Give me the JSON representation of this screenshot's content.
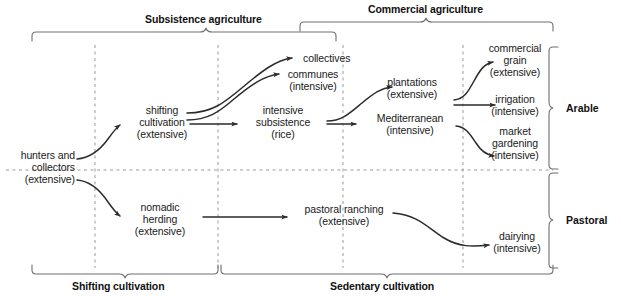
{
  "diagram": {
    "type": "flow-diagram",
    "colors": {
      "background": "#ffffff",
      "text": "#1a1a1a",
      "arrow": "#2b2b2b",
      "bracket": "#6f6f6f",
      "dashed_guide": "#9a9a9a"
    }
  },
  "top_groups": [
    {
      "label": "Subsistence agriculture",
      "span_start_x": 32,
      "span_end_x": 336,
      "tick_x": 206
    },
    {
      "label": "Commercial agriculture",
      "span_start_x": 300,
      "span_end_x": 553,
      "tick_x": 426
    }
  ],
  "bottom_groups": [
    {
      "label": "Shifting cultivation",
      "span_start_x": 32,
      "span_end_x": 218,
      "tick_x": 125
    },
    {
      "label": "Sedentary cultivation",
      "span_start_x": 221,
      "span_end_x": 553,
      "tick_x": 387
    }
  ],
  "side_groups": [
    {
      "label": "Arable",
      "span_start_y": 47,
      "span_end_y": 169,
      "tick_y": 108
    },
    {
      "label": "Pastoral",
      "span_start_y": 173,
      "span_end_y": 268,
      "tick_y": 220
    }
  ],
  "nodes": [
    {
      "id": "hunters",
      "lines": [
        "hunters and",
        "collectors",
        "(extensive)"
      ],
      "x": 3,
      "y": 149,
      "align": "right",
      "width": 72
    },
    {
      "id": "shifting",
      "lines": [
        "shifting",
        "cultivation",
        "(extensive)"
      ],
      "x": 121,
      "y": 104,
      "align": "center",
      "width": 82
    },
    {
      "id": "nomadic",
      "lines": [
        "nomadic",
        "herding",
        "(extensive)"
      ],
      "x": 119,
      "y": 201,
      "align": "center",
      "width": 82
    },
    {
      "id": "collectives",
      "lines": [
        "collectives"
      ],
      "x": 303,
      "y": 52,
      "align": "left",
      "width": 70
    },
    {
      "id": "communes",
      "lines": [
        "communes",
        "(intensive)"
      ],
      "x": 274,
      "y": 68,
      "align": "center",
      "width": 78
    },
    {
      "id": "intensive_sub",
      "lines": [
        "intensive",
        "subsistence",
        "(rice)"
      ],
      "x": 244,
      "y": 104,
      "align": "center",
      "width": 78
    },
    {
      "id": "plantations",
      "lines": [
        "plantations",
        "(extensive)"
      ],
      "x": 371,
      "y": 76,
      "align": "center",
      "width": 82
    },
    {
      "id": "mediterranean",
      "lines": [
        "Mediterranean",
        "(intensive)"
      ],
      "x": 362,
      "y": 112,
      "align": "center",
      "width": 96
    },
    {
      "id": "comm_grain",
      "lines": [
        "commercial",
        "grain",
        "(extensive)"
      ],
      "x": 477,
      "y": 42,
      "align": "center",
      "width": 76
    },
    {
      "id": "irrigation",
      "lines": [
        "irrigation",
        "(intensive)"
      ],
      "x": 477,
      "y": 93,
      "align": "center",
      "width": 76
    },
    {
      "id": "market_gard",
      "lines": [
        "market",
        "gardening",
        "(intensive)"
      ],
      "x": 477,
      "y": 125,
      "align": "center",
      "width": 76
    },
    {
      "id": "pastoral_ranch",
      "lines": [
        "pastoral ranching",
        "(extensive)"
      ],
      "x": 292,
      "y": 203,
      "align": "center",
      "width": 104
    },
    {
      "id": "dairying",
      "lines": [
        "dairying",
        "(intensive)"
      ],
      "x": 480,
      "y": 230,
      "align": "center",
      "width": 74
    }
  ],
  "edges": [
    {
      "id": "hunters-to-shifting",
      "from": "hunters",
      "to": "shifting"
    },
    {
      "id": "hunters-to-nomadic",
      "from": "hunters",
      "to": "nomadic"
    },
    {
      "id": "shifting-to-collectives",
      "from": "shifting",
      "to": "collectives"
    },
    {
      "id": "shifting-to-communes",
      "from": "shifting",
      "to": "communes"
    },
    {
      "id": "shifting-to-intensive-sub",
      "from": "shifting",
      "to": "intensive_sub"
    },
    {
      "id": "intensive-sub-to-plantations",
      "from": "intensive_sub",
      "to": "plantations"
    },
    {
      "id": "intensive-sub-to-mediterranean",
      "from": "intensive_sub",
      "to": "mediterranean"
    },
    {
      "id": "plantations-to-comm-grain",
      "from": "plantations",
      "to": "comm_grain"
    },
    {
      "id": "plantations-to-irrigation",
      "from": "plantations",
      "to": "irrigation"
    },
    {
      "id": "mediterranean-to-market-gardening",
      "from": "mediterranean",
      "to": "market_gard"
    },
    {
      "id": "nomadic-to-pastoral-ranching",
      "from": "nomadic",
      "to": "pastoral_ranch"
    },
    {
      "id": "pastoral-ranching-to-dairying",
      "from": "pastoral_ranch",
      "to": "dairying"
    }
  ],
  "guides": {
    "vertical_dashed_x": [
      95,
      218,
      343,
      463
    ],
    "vertical_dashed_y_range": [
      45,
      268
    ],
    "horizontal_dashed_y": 170,
    "horizontal_dashed_x_range": [
      6,
      553
    ]
  }
}
